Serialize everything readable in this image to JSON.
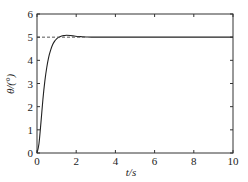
{
  "chart_data": {
    "type": "line",
    "title": "",
    "xlabel": "t/s",
    "ylabel": "θ/(°)",
    "xlim": [
      0,
      10
    ],
    "ylim": [
      0,
      6
    ],
    "xticks": [
      0,
      2,
      4,
      6,
      8,
      10
    ],
    "yticks": [
      0,
      1,
      2,
      3,
      4,
      5,
      6
    ],
    "grid": false,
    "legend": null,
    "series": [
      {
        "name": "response",
        "style": "solid",
        "x": [
          0,
          0.1,
          0.2,
          0.3,
          0.4,
          0.5,
          0.6,
          0.7,
          0.8,
          0.9,
          1.0,
          1.1,
          1.2,
          1.3,
          1.4,
          1.5,
          1.7,
          1.9,
          2.1,
          2.3,
          2.5,
          3,
          4,
          6,
          8,
          10
        ],
        "y": [
          0,
          0.4,
          1.3,
          2.3,
          3.1,
          3.7,
          4.15,
          4.45,
          4.68,
          4.83,
          4.93,
          4.99,
          5.03,
          5.06,
          5.07,
          5.08,
          5.07,
          5.05,
          5.03,
          5.02,
          5.01,
          5.0,
          5.0,
          5.0,
          5.0,
          5.0
        ]
      },
      {
        "name": "reference",
        "style": "dashed",
        "x": [
          0,
          2.5
        ],
        "y": [
          5,
          5
        ]
      }
    ]
  },
  "colors": {
    "axis": "#333333",
    "curve": "#222222",
    "reference": "#555555"
  }
}
